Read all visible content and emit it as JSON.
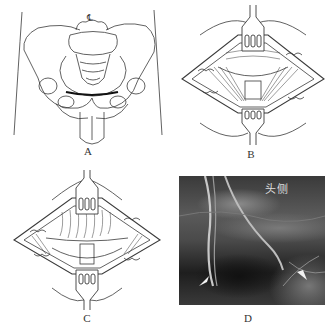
{
  "figure": {
    "panels": [
      {
        "id": "A",
        "label": "A",
        "type": "illustration",
        "subject": "pelvis-anterior-view-with-incision-line",
        "symbol": "℄"
      },
      {
        "id": "B",
        "label": "B",
        "type": "illustration",
        "subject": "retracted-incision-showing-muscle-layers"
      },
      {
        "id": "C",
        "label": "C",
        "type": "illustration",
        "subject": "retracted-incision-deeper-dissection"
      },
      {
        "id": "D",
        "label": "D",
        "type": "photograph",
        "subject": "intraoperative-photo-with-two-slings",
        "annotation": "头侧"
      }
    ]
  },
  "colors": {
    "line": "#3a3a3a",
    "incision": "#111111",
    "photo_dark": "#2a2a2a",
    "photo_mid": "#6b6b6b",
    "background": "#ffffff"
  }
}
